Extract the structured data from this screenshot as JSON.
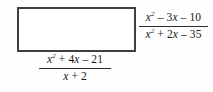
{
  "problem": {
    "type": "rational-expression-multiplication",
    "answer_box": {
      "name": "empty-answer-box",
      "value": "",
      "placeholder": ""
    },
    "fraction_right": {
      "numerator": "x² – 3x – 10",
      "denominator": "x² + 2x – 35",
      "numerator_parts": {
        "term1_var": "x",
        "term1_exp": "2",
        "term2": " – 3",
        "term2_var": "x",
        "term3": " – 10"
      },
      "denominator_parts": {
        "term1_var": "x",
        "term1_exp": "2",
        "term2": " + 2",
        "term2_var": "x",
        "term3": " – 35"
      }
    },
    "fraction_bottom": {
      "numerator": "x² + 4x – 21",
      "denominator": "x + 2",
      "numerator_parts": {
        "term1_var": "x",
        "term1_exp": "2",
        "term2": " + 4",
        "term2_var": "x",
        "term3": " – 21"
      },
      "denominator_parts": {
        "term1_var": "x",
        "term2": " + 2"
      }
    }
  },
  "colors": {
    "box_border": "#404040",
    "text": "#1a1a1a",
    "rule": "#2b2b2b",
    "background": "#fefefe"
  }
}
